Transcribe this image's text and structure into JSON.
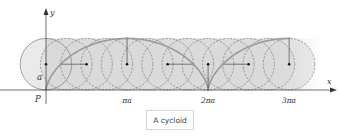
{
  "figure": {
    "axes": {
      "x_label": "x",
      "y_label": "y",
      "origin_label": "P",
      "radius_label": "a",
      "ticks": [
        {
          "label": "πa",
          "t": 3.14159
        },
        {
          "label": "2πa",
          "t": 6.28318
        },
        {
          "label": "3πa",
          "t": 9.42478
        }
      ]
    },
    "geometry": {
      "origin_px": [
        46,
        90
      ],
      "a_px": 25.8,
      "t_max": 9.42478,
      "dashed_circle_step": 0.785398,
      "radius_line_ts": [
        1.5708,
        3.14159,
        4.71239,
        6.28318,
        7.85398,
        9.42478
      ]
    },
    "colors": {
      "band": "#dcdcdc",
      "circle_fill": "#d9d9d9",
      "circle_stroke": "#8a8a8a",
      "dashed_stroke": "#7a7a7a",
      "curve": "#9a9a9a",
      "axis": "#333333",
      "dot": "#111111"
    }
  },
  "caption": {
    "text": "A cycloid"
  }
}
